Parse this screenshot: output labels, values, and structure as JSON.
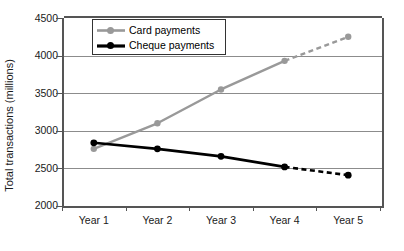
{
  "chart_data": {
    "type": "line",
    "title": "",
    "xlabel": "",
    "ylabel": "Total transactions (millions)",
    "categories": [
      "Year 1",
      "Year 2",
      "Year 3",
      "Year 4",
      "Year 5"
    ],
    "ylim": [
      2000,
      4500
    ],
    "ytick_step": 500,
    "yticks": [
      "4500",
      "4000",
      "3500",
      "3000",
      "2500",
      "2000"
    ],
    "grid": true,
    "legend_position": "top-left-inside",
    "series": [
      {
        "name": "Card payments",
        "color": "#999999",
        "values": [
          2760,
          3100,
          3550,
          3930,
          4250
        ],
        "solid_through_index": 3,
        "dashed_from_index": 3
      },
      {
        "name": "Cheque payments",
        "color": "#000000",
        "values": [
          2840,
          2760,
          2660,
          2520,
          2410
        ],
        "solid_through_index": 3,
        "dashed_from_index": 3
      }
    ]
  },
  "axes": {
    "y_title": "Total transactions (millions)",
    "y_tick_labels": [
      "4500",
      "4000",
      "3500",
      "3000",
      "2500",
      "2000"
    ],
    "x_tick_labels": [
      "Year 1",
      "Year 2",
      "Year 3",
      "Year 4",
      "Year 5"
    ]
  },
  "legend": {
    "items": [
      {
        "label": "Card payments",
        "color": "#999999"
      },
      {
        "label": "Cheque payments",
        "color": "#000000"
      }
    ]
  },
  "colors": {
    "card_series": "#999999",
    "cheque_series": "#000000",
    "gridline": "#8c8c8c",
    "axis": "#555555",
    "background": "#ffffff"
  }
}
